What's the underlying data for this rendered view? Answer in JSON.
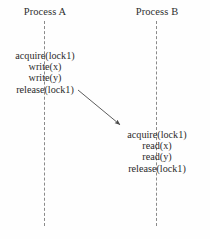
{
  "diagram": {
    "background_color": "#fefefe",
    "stroke_color": "#8a8a8a",
    "text_color": "#2b2b2b",
    "lifelines": [
      {
        "id": "a",
        "header": "Process A",
        "style": "dashed",
        "x": 44
      },
      {
        "id": "b",
        "header": "Process B",
        "style": "dashed",
        "x": 156
      }
    ],
    "process_a": {
      "header": "Process A",
      "operations": [
        "acquire(lock1)",
        "write(x)",
        "write(y)",
        "release(lock1)"
      ]
    },
    "process_b": {
      "header": "Process B",
      "operations": [
        "acquire(lock1)",
        "read(x)",
        "read(y)",
        "release(lock1)"
      ]
    },
    "arrow": {
      "name": "lock-handoff-arrow",
      "from": {
        "x": 78,
        "y": 90
      },
      "to": {
        "x": 124,
        "y": 128
      },
      "label": "",
      "head": "solid-triangle",
      "color": "#4a4a4a"
    }
  }
}
